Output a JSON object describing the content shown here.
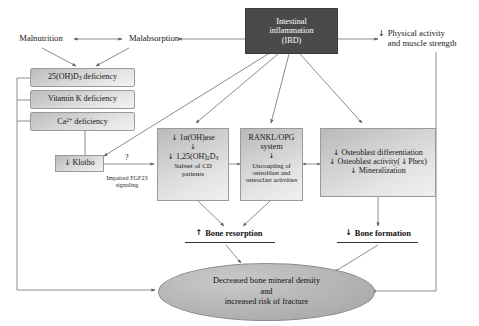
{
  "diagram": {
    "type": "flowchart",
    "background": "#ffffff",
    "colors": {
      "dark_box": "#4a4a4a",
      "dark_box_text": "#ffffff",
      "grey_box": "#d2d2d2",
      "grey_box_border": "#9a9a9a",
      "ellipse_fill": "#b4b4b4",
      "connector": "#6f6f6f",
      "text": "#161616"
    }
  },
  "nodes": {
    "intestinal_inflammation": {
      "line1": "Intestinal",
      "line2": "inflammation",
      "line3": "(IBD)",
      "style": "dark"
    },
    "malnutrition": {
      "label": "Malnutrition"
    },
    "malabsorption": {
      "label": "Malabsorption"
    },
    "physical_activity": {
      "arrow": "↓",
      "line1": "Physical activity",
      "line2": "and muscle strength"
    },
    "deficiency_stack": [
      {
        "prefix": "25(OH)D",
        "sub": "3",
        "suffix": " deficiency"
      },
      {
        "prefix": "Vitamin K deficiency",
        "sub": "",
        "suffix": ""
      },
      {
        "prefix": "Ca",
        "sup": "2+",
        "suffix": " deficiency"
      }
    ],
    "klotho": {
      "arrow": "↓",
      "label": "Klotho"
    },
    "fgf23": {
      "line1": "Impaired FGF23",
      "line2": "signaling",
      "question": "?"
    },
    "vitamin_d_box": {
      "row1_arrow": "↓",
      "row1": "1α(OH)ase",
      "down": "↓",
      "row2_arrow": "↓",
      "row2_prefix": "1,25(OH)",
      "row2_sub": "2",
      "row2_suffix": "D",
      "row2_sub2": "3",
      "note1": "Subset of CD",
      "note2": "patients"
    },
    "rankl_box": {
      "line1": "RANKL/OPG",
      "line2": "system",
      "down": "↓",
      "line3": "Uncoupling of",
      "line4": "osteoblast and",
      "line5": "osteoclast activities"
    },
    "osteoblast_box": {
      "row1_arrow": "↓",
      "row1": "Osteoblast differentiation",
      "row2_arrow": "↓",
      "row2_a": "Osteoblast activity(",
      "row2_arrow2": "↓",
      "row2_b": "Phex)",
      "row3_arrow": "↓",
      "row3": "Mineralization"
    },
    "bone_resorption": {
      "arrow": "↑",
      "label": "Bone resorption"
    },
    "bone_formation": {
      "arrow": "↓",
      "label": "Bone formation"
    },
    "outcome": {
      "line1": "Decreased bone mineral density",
      "line2": "and",
      "line3": "increased risk of fracture"
    }
  },
  "edges": [
    {
      "from": "intestinal_inflammation",
      "to": "malabsorption",
      "type": "arrow"
    },
    {
      "from": "malabsorption",
      "to": "malnutrition",
      "type": "double-arrow"
    },
    {
      "from": "intestinal_inflammation",
      "to": "physical_activity",
      "type": "arrow"
    },
    {
      "from": "malnutrition",
      "to": "deficiency_stack",
      "type": "arrow"
    },
    {
      "from": "malabsorption",
      "to": "deficiency_stack",
      "type": "arrow"
    },
    {
      "from": "intestinal_inflammation",
      "to": "klotho",
      "type": "arrow"
    },
    {
      "from": "intestinal_inflammation",
      "to": "vitamin_d_box",
      "type": "arrow"
    },
    {
      "from": "intestinal_inflammation",
      "to": "rankl_box",
      "type": "arrow"
    },
    {
      "from": "intestinal_inflammation",
      "to": "osteoblast_box",
      "type": "arrow"
    },
    {
      "from": "klotho",
      "to": "deficiency_stack",
      "type": "arrow"
    },
    {
      "from": "klotho",
      "to": "vitamin_d_box",
      "type": "arrow-labeled",
      "label": "?"
    },
    {
      "from": "vitamin_d_box",
      "to": "rankl_box",
      "type": "arrow"
    },
    {
      "from": "rankl_box",
      "to": "osteoblast_box",
      "type": "double-arrow"
    },
    {
      "from": "vitamin_d_box",
      "to": "bone_resorption",
      "type": "arrow"
    },
    {
      "from": "rankl_box",
      "to": "bone_resorption",
      "type": "arrow"
    },
    {
      "from": "osteoblast_box",
      "to": "bone_formation",
      "type": "arrow"
    },
    {
      "from": "bone_resorption",
      "to": "outcome",
      "type": "arrow"
    },
    {
      "from": "bone_formation",
      "to": "outcome",
      "type": "arrow"
    },
    {
      "from": "deficiency_stack",
      "to": "outcome",
      "type": "arrow"
    },
    {
      "from": "physical_activity",
      "to": "outcome",
      "type": "arrow"
    }
  ]
}
